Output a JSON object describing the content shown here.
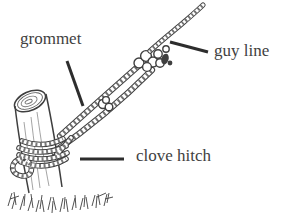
{
  "figure": {
    "background_color": "#ffffff",
    "ink_color": "#3f3f3f",
    "pointer_color": "#2d2d2d"
  },
  "labels": {
    "grommet": {
      "text": "grommet"
    },
    "guy_line": {
      "text": "guy line"
    },
    "clove_hitch": {
      "text": "clove hitch"
    }
  }
}
